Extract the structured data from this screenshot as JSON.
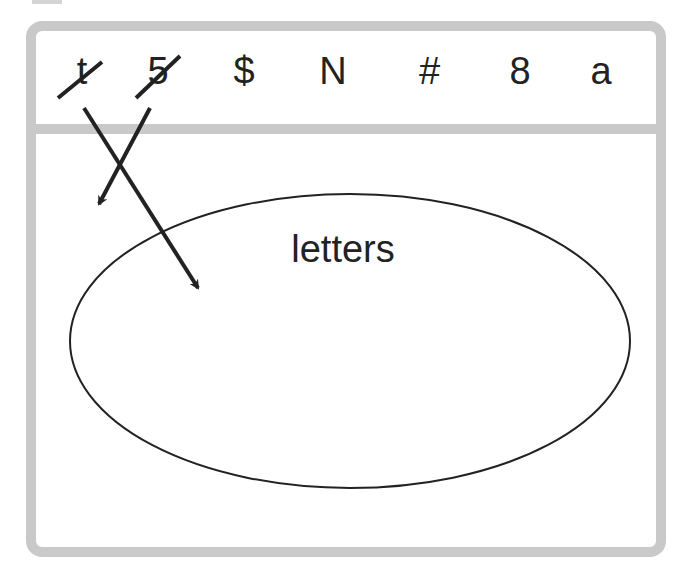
{
  "symbols": [
    {
      "text": "t",
      "crossed": true,
      "x": 82
    },
    {
      "text": "5",
      "crossed": true,
      "x": 158
    },
    {
      "text": "$",
      "crossed": false,
      "x": 244
    },
    {
      "text": "N",
      "crossed": false,
      "x": 333
    },
    {
      "text": "#",
      "crossed": false,
      "x": 429
    },
    {
      "text": "8",
      "crossed": false,
      "x": 520
    },
    {
      "text": "a",
      "crossed": false,
      "x": 601
    }
  ],
  "set_label": "letters",
  "colors": {
    "frame": "#c9c9c9",
    "ink": "#222222"
  }
}
